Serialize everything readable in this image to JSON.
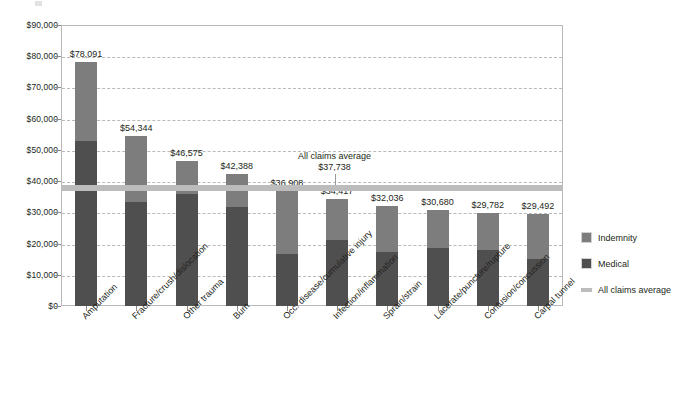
{
  "chart_data": {
    "type": "bar",
    "subtype": "stacked-vertical",
    "title": "",
    "xlabel": "",
    "ylabel": "",
    "ylim": [
      0,
      90000
    ],
    "ytick_values": [
      0,
      10000,
      20000,
      30000,
      40000,
      50000,
      60000,
      70000,
      80000,
      90000
    ],
    "ytick_labels": [
      "$0",
      "$10,000",
      "$20,000",
      "$30,000",
      "$40,000",
      "$50,000",
      "$60,000",
      "$70,000",
      "$80,000",
      "$90,000"
    ],
    "grid": true,
    "grid_style": "dashed-horizontal",
    "legend_position": "right",
    "categories": [
      "Amputation",
      "Fracture/crush/dislocation",
      "Other trauma",
      "Burn",
      "Occ. disease/cumulative injury",
      "Infection/inflammation",
      "Sprain/strain",
      "Lacerate/puncture/rupture",
      "Contusion/concussion",
      "Carpal tunnel"
    ],
    "series": [
      {
        "name": "Medical",
        "color": "#4f4f4f",
        "values": [
          53000,
          33400,
          36000,
          31700,
          16600,
          21000,
          17200,
          18500,
          18000,
          15000
        ]
      },
      {
        "name": "Indemnity",
        "color": "#7d7d7d",
        "values": [
          25091,
          20944,
          10575,
          10688,
          20308,
          13417,
          14836,
          12180,
          11782,
          14492
        ]
      }
    ],
    "totals": [
      78091,
      54344,
      46575,
      42388,
      36908,
      34417,
      32036,
      30680,
      29782,
      29492
    ],
    "total_labels": [
      "$78,091",
      "$54,344",
      "$46,575",
      "$42,388",
      "$36,908",
      "$34,417",
      "$32,036",
      "$30,680",
      "$29,782",
      "$29,492"
    ],
    "reference_line": {
      "name": "All claims average",
      "value": 37738,
      "value_label": "$37,738",
      "color": "#bcbcbc"
    }
  },
  "annotation": {
    "line1": "All claims average",
    "line2": "$37,738"
  },
  "legend": {
    "items": [
      {
        "label": "Indemnity",
        "color": "#7d7d7d",
        "swatch": "square"
      },
      {
        "label": "Medical",
        "color": "#4f4f4f",
        "swatch": "square"
      },
      {
        "label": "All claims average",
        "color": "#bcbcbc",
        "swatch": "line"
      }
    ]
  }
}
